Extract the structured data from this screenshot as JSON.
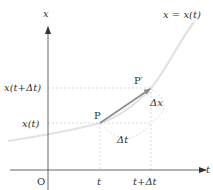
{
  "diagram": {
    "axes": {
      "x_axis_label": "t",
      "y_axis_label": "x",
      "origin_label": "O"
    },
    "curve": {
      "label": "x = x(t)",
      "color": "#e6e6e6"
    },
    "points": {
      "p_label": "P",
      "p_prime_label": "P′"
    },
    "ticks": {
      "x_ticks": [
        "t",
        "t+Δt"
      ],
      "y_ticks": [
        "x(t)",
        "x(t+Δt)"
      ]
    },
    "increments": {
      "delta_t_label": "Δt",
      "delta_x_label": "Δx"
    },
    "colors": {
      "axis": "#555555",
      "secant_arrow": "#8c8c8c",
      "dashed_guides": "#cfcfcf",
      "text": "#333333"
    }
  }
}
